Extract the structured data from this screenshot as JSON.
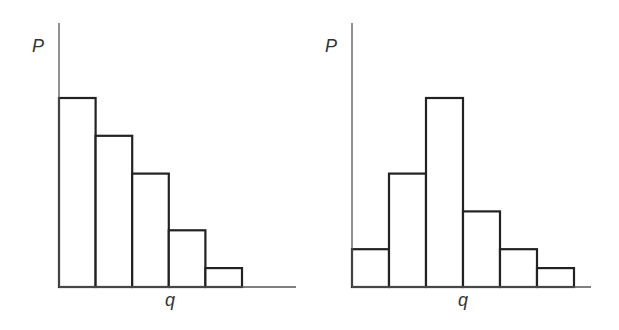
{
  "chart_data": [
    {
      "type": "bar",
      "title": "",
      "xlabel": "q",
      "ylabel": "P",
      "categories": [
        "1",
        "2",
        "3",
        "4",
        "5"
      ],
      "values": [
        10,
        8,
        6,
        3,
        1
      ],
      "grid": false,
      "legend": null
    },
    {
      "type": "bar",
      "title": "",
      "xlabel": "q",
      "ylabel": "P",
      "categories": [
        "1",
        "2",
        "3",
        "4",
        "5",
        "6"
      ],
      "values": [
        2,
        6,
        10,
        4,
        2,
        1
      ],
      "grid": false,
      "legend": null
    }
  ],
  "layout": {
    "panels": [
      {
        "axis_x": 59,
        "axis_top": 23,
        "baseline": 287,
        "x_end": 296,
        "bar_width": 36.6,
        "unit": 18.9,
        "ylabel_pos": [
          32,
          52
        ],
        "xlabel_pos": [
          165,
          306
        ]
      },
      {
        "axis_x": 352,
        "axis_top": 23,
        "baseline": 287,
        "x_end": 591,
        "bar_width": 37,
        "unit": 18.9,
        "ylabel_pos": [
          325,
          52
        ],
        "xlabel_pos": [
          458,
          306
        ]
      }
    ]
  }
}
